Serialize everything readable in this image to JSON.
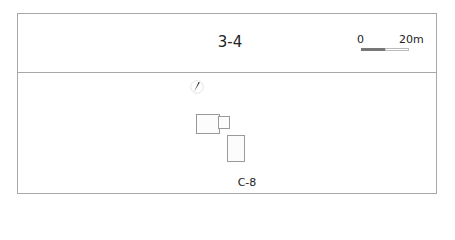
{
  "map": {
    "title": "3-4",
    "scale_bar": {
      "start_label": "0",
      "end_label": "20m"
    },
    "compass": {
      "icon": "north-arrow-icon"
    },
    "buildings": [
      {
        "id": "main",
        "x": 196,
        "y": 114,
        "w": 24,
        "h": 20
      },
      {
        "id": "annex",
        "x": 218,
        "y": 116,
        "w": 12,
        "h": 13
      },
      {
        "id": "south",
        "x": 227,
        "y": 135,
        "w": 18,
        "h": 27
      }
    ],
    "site_label": "C-8"
  }
}
